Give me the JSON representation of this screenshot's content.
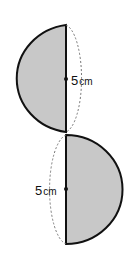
{
  "figure": {
    "fill_color": "#c8c8c8",
    "stroke_color": "#111111",
    "dashed_color": "#777777",
    "top_semicircle": {
      "label_value": "5",
      "label_unit": "cm"
    },
    "bottom_semicircle": {
      "label_value": "5",
      "label_unit": "cm"
    }
  }
}
